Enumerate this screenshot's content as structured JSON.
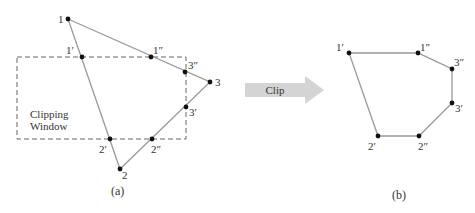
{
  "figure_a": {
    "caption": "(a)",
    "window_label_line1": "Clipping",
    "window_label_line2": "Window",
    "clip_window": {
      "x": 17,
      "y": 57,
      "w": 169,
      "h": 82
    },
    "points": {
      "p1": {
        "label": "1",
        "x": 68,
        "y": 19
      },
      "p2": {
        "label": "2",
        "x": 120,
        "y": 169
      },
      "p3": {
        "label": "3",
        "x": 210,
        "y": 82
      },
      "p1a": {
        "label": "1′",
        "x": 82,
        "y": 57
      },
      "p1b": {
        "label": "1″",
        "x": 151,
        "y": 57
      },
      "p3b": {
        "label": "3″",
        "x": 185,
        "y": 72
      },
      "p3a": {
        "label": "3′",
        "x": 186,
        "y": 107
      },
      "p2a": {
        "label": "2′",
        "x": 110,
        "y": 139
      },
      "p2b": {
        "label": "2″",
        "x": 152,
        "y": 139
      }
    }
  },
  "arrow": {
    "label": "Clip",
    "color": "#d0d0d0"
  },
  "figure_b": {
    "caption": "(b)",
    "points": {
      "p1a": {
        "label": "1′",
        "x": 349,
        "y": 53
      },
      "p1b": {
        "label": "1″",
        "x": 418,
        "y": 53
      },
      "p3b": {
        "label": "3″",
        "x": 452,
        "y": 69
      },
      "p3a": {
        "label": "3′",
        "x": 452,
        "y": 103
      },
      "p2b": {
        "label": "2″",
        "x": 419,
        "y": 136
      },
      "p2a": {
        "label": "2′",
        "x": 378,
        "y": 136
      }
    }
  },
  "colors": {
    "edge": "#999999",
    "dash": "#666666",
    "point": "#111111",
    "text": "#333333"
  }
}
